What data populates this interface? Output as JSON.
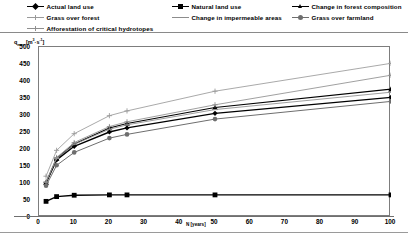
{
  "legend": {
    "entries": [
      {
        "label": "Actual land use",
        "marker": "diamond",
        "color": "#000000",
        "line": "solid",
        "lw": 1.3
      },
      {
        "label": "Natural land use",
        "marker": "square",
        "color": "#000000",
        "line": "solid",
        "lw": 1.3
      },
      {
        "label": "Change in forest composition",
        "marker": "triangle",
        "color": "#000000",
        "line": "solid",
        "lw": 1.1
      },
      {
        "label": "Grass over forest",
        "marker": "cross",
        "color": "#9a9a9a",
        "line": "solid",
        "lw": 0.9
      },
      {
        "label": "Change in impermeable areas",
        "marker": "dash",
        "color": "#8c8c8c",
        "line": "solid",
        "lw": 0.9
      },
      {
        "label": "Grass over farmland",
        "marker": "circle",
        "color": "#6e6e6e",
        "line": "solid",
        "lw": 1.0
      },
      {
        "label": "Afforestation of critical hydrotopes",
        "marker": "cross",
        "color": "#8f8f8f",
        "line": "solid",
        "lw": 0.9
      }
    ]
  },
  "axes": {
    "ylabel_main": "q",
    "ylabel_sub": "max",
    "ylabel_units_open": " [m",
    "ylabel_units_sup1": "3",
    "ylabel_units_mid": "·s",
    "ylabel_units_sup2": "-1",
    "ylabel_units_close": "]",
    "xlabel": "N [years]",
    "yticks": [
      "0",
      "50",
      "100",
      "150",
      "200",
      "250",
      "300",
      "350",
      "400",
      "450",
      "500"
    ],
    "xticks": [
      "0",
      "10",
      "20",
      "30",
      "40",
      "50",
      "60",
      "70",
      "80",
      "90",
      "100"
    ]
  },
  "chart_data": {
    "type": "line",
    "title": "",
    "xlabel": "N [years]",
    "ylabel": "qmax [m3·s-1]",
    "xlim": [
      0,
      100
    ],
    "ylim": [
      0,
      500
    ],
    "grid": false,
    "legend_position": "top",
    "x": [
      2,
      5,
      10,
      20,
      25,
      50,
      100
    ],
    "series": [
      {
        "name": "Actual land use",
        "marker": "diamond",
        "color": "#000000",
        "values": [
          100,
          168,
          208,
          250,
          262,
          305,
          352
        ]
      },
      {
        "name": "Natural land use",
        "marker": "square",
        "color": "#000000",
        "values": [
          46,
          60,
          64,
          65,
          65,
          65,
          65
        ]
      },
      {
        "name": "Change in forest composition",
        "marker": "triangle",
        "color": "#000000",
        "values": [
          101,
          172,
          215,
          262,
          275,
          322,
          376
        ]
      },
      {
        "name": "Grass over forest",
        "marker": "cross",
        "color": "#9a9a9a",
        "values": [
          120,
          196,
          245,
          298,
          312,
          370,
          452
        ]
      },
      {
        "name": "Change in impermeable areas",
        "marker": "dash",
        "color": "#8c8c8c",
        "values": [
          102,
          172,
          214,
          258,
          271,
          316,
          367
        ]
      },
      {
        "name": "Grass over farmland",
        "marker": "circle",
        "color": "#6e6e6e",
        "values": [
          92,
          152,
          190,
          232,
          243,
          288,
          340
        ]
      },
      {
        "name": "Afforestation of critical hydrotopes",
        "marker": "cross",
        "color": "#8f8f8f",
        "values": [
          103,
          175,
          219,
          266,
          280,
          330,
          417
        ]
      }
    ]
  }
}
